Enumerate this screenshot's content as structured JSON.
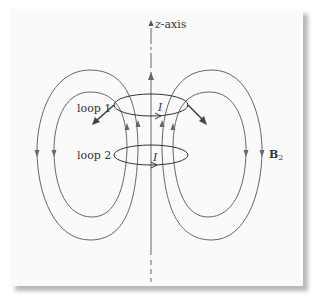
{
  "diagram": {
    "axis_label_var": "z",
    "axis_label_suffix": "-axis",
    "loop1_label": "loop 1",
    "loop2_label": "loop 2",
    "current_label_1": "I",
    "current_label_2": "I",
    "field_label_main": "B",
    "field_label_sub": "2",
    "colors": {
      "line": "#666666",
      "arrow": "#555555",
      "loop": "#333333",
      "background": "#fafafa",
      "shadow": "#bbbbbb"
    }
  }
}
